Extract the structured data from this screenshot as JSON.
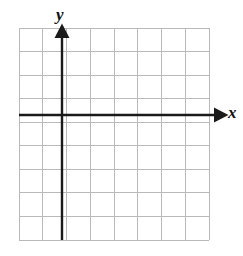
{
  "figure": {
    "name": "blank-cartesian-coordinate-grid",
    "type": "coordinate-plane",
    "width": 243,
    "height": 256,
    "background_color": "#ffffff"
  },
  "chart_data": {
    "type": "scatter",
    "title": "",
    "xlabel": "x",
    "ylabel": "y",
    "x": [],
    "y": [],
    "series": [],
    "grid": true,
    "legend": false,
    "annotations": [],
    "xlim": [
      -2,
      6
    ],
    "ylim": [
      -5,
      4
    ],
    "xticks": [
      -2,
      -1,
      0,
      1,
      2,
      3,
      4,
      5,
      6
    ],
    "yticks": [
      -5,
      -4,
      -3,
      -2,
      -1,
      0,
      1,
      2,
      3,
      4
    ],
    "xtick_labels": [],
    "ytick_labels": [],
    "columns": 8,
    "rows": 9,
    "origin_column_index": 2,
    "origin_row_index": 4
  },
  "grid": {
    "left": 19,
    "top": 28,
    "right": 209,
    "bottom": 240,
    "columns": 8,
    "rows": 9,
    "cell_width": 23.75,
    "cell_height": 23.55,
    "line_color": "#b9b9b9",
    "line_width": 1,
    "border_color": "#c3c3c3"
  },
  "axes": {
    "color": "#1a1a1a",
    "stroke_width": 2.4,
    "x_axis": {
      "name": "x-axis",
      "label": "x",
      "y_position": 115,
      "start_x": 19,
      "end_x": 221,
      "arrow": "right"
    },
    "y_axis": {
      "name": "y-axis",
      "label": "y",
      "x_position": 62,
      "start_y": 240,
      "end_y": 31,
      "arrow": "up"
    }
  },
  "labels": {
    "y_label": "y",
    "x_label": "x"
  }
}
